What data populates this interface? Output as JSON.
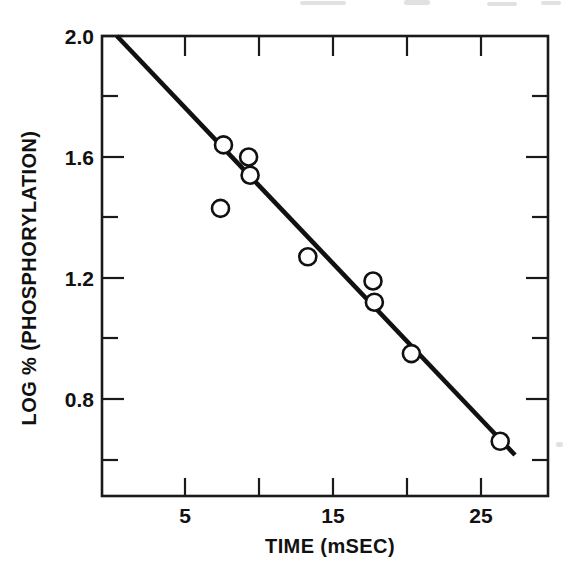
{
  "figure": {
    "background_color": "#ffffff",
    "ink_color": "#111111",
    "marker_fill": "#ffffff"
  },
  "chart_data": {
    "type": "scatter",
    "title": "",
    "subtitle": "",
    "xlabel": "TIME (mSEC)",
    "ylabel": "LOG % (PHOSPHORYLATION)",
    "xlim": [
      0.4,
      30.5
    ],
    "ylim": [
      0.52,
      2.0
    ],
    "grid": false,
    "legend": null,
    "x_major_ticks": [
      5,
      15,
      25
    ],
    "x_major_tick_labels": [
      "5",
      "15",
      "25"
    ],
    "x_minor_ticks": [
      10,
      20
    ],
    "y_major_ticks": [
      2.0,
      1.6,
      1.2,
      0.8
    ],
    "y_major_tick_labels": [
      "2.0",
      "1.6",
      "1.2",
      "0.8"
    ],
    "y_minor_ticks": [
      1.8,
      1.4,
      1.0,
      0.6
    ],
    "series": [
      {
        "name": "observed",
        "marker": "open-circle",
        "x": [
          7.4,
          7.6,
          9.3,
          9.4,
          13.3,
          17.7,
          17.8,
          20.3,
          26.3
        ],
        "y": [
          1.43,
          1.64,
          1.6,
          1.54,
          1.27,
          1.19,
          1.12,
          0.95,
          0.66
        ]
      },
      {
        "name": "regression-line",
        "type": "line",
        "x": [
          0.4,
          27.3
        ],
        "y": [
          2.0,
          0.615
        ]
      }
    ],
    "annotations": []
  },
  "axes": {
    "x_axis_title": "TIME (mSEC)",
    "y_axis_title": "LOG % (PHOSPHORYLATION)"
  }
}
